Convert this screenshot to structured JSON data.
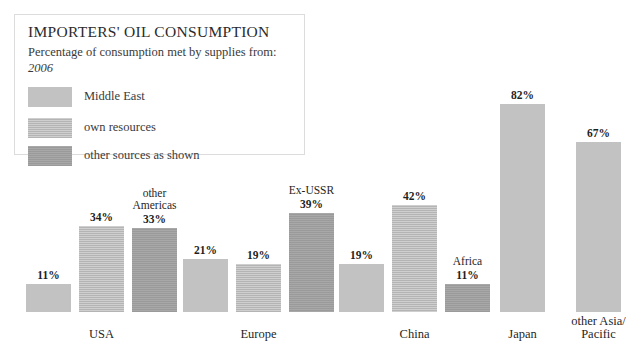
{
  "legend": {
    "title": "IMPORTERS' OIL CONSUMPTION",
    "subtitle": "Percentage of consumption met by supplies from:",
    "year": "2006",
    "items": [
      {
        "label": "Middle East",
        "swatch": "solid-swatch",
        "color": "#c2c2c2"
      },
      {
        "label": "own resources",
        "swatch": "striped-swatch",
        "color": "#c7c7c7"
      },
      {
        "label": "other sources as shown",
        "swatch": "dark-swatch",
        "color": "#a3a3a3"
      }
    ]
  },
  "chart_data": {
    "type": "bar",
    "title": "IMPORTERS' OIL CONSUMPTION",
    "subtitle": "Percentage of consumption met by supplies from:",
    "year": "2006",
    "xlabel": "",
    "ylabel": "Percentage of consumption",
    "ylim": [
      0,
      100
    ],
    "grid": false,
    "legend_position": "top-left",
    "categories": [
      "USA",
      "Europe",
      "China",
      "Japan",
      "other Asia/ Pacific"
    ],
    "series": [
      {
        "name": "Middle East",
        "values": [
          11,
          21,
          19,
          82,
          67
        ]
      },
      {
        "name": "own resources",
        "values": [
          34,
          19,
          42,
          null,
          null
        ]
      },
      {
        "name": "other sources as shown",
        "values": [
          33,
          39,
          11,
          null,
          null
        ]
      }
    ],
    "other_source_names": [
      "other Americas",
      "Ex-USSR",
      "Africa",
      null,
      null
    ],
    "groups": [
      {
        "name": "USA",
        "label_lines": [
          "USA"
        ],
        "bars": [
          {
            "series": "Middle East",
            "value": 11,
            "value_label": "11%",
            "sublabel": "",
            "fill": "solid"
          },
          {
            "series": "own resources",
            "value": 34,
            "value_label": "34%",
            "sublabel": "",
            "fill": "striped"
          },
          {
            "series": "other sources",
            "value": 33,
            "value_label": "33%",
            "sublabel": "other\nAmericas",
            "fill": "dark"
          }
        ]
      },
      {
        "name": "Europe",
        "label_lines": [
          "Europe"
        ],
        "bars": [
          {
            "series": "Middle East",
            "value": 21,
            "value_label": "21%",
            "sublabel": "",
            "fill": "solid"
          },
          {
            "series": "own resources",
            "value": 19,
            "value_label": "19%",
            "sublabel": "",
            "fill": "striped"
          },
          {
            "series": "other sources",
            "value": 39,
            "value_label": "39%",
            "sublabel": "Ex-USSR",
            "fill": "dark"
          }
        ]
      },
      {
        "name": "China",
        "label_lines": [
          "China"
        ],
        "bars": [
          {
            "series": "Middle East",
            "value": 19,
            "value_label": "19%",
            "sublabel": "",
            "fill": "solid"
          },
          {
            "series": "own resources",
            "value": 42,
            "value_label": "42%",
            "sublabel": "",
            "fill": "striped"
          },
          {
            "series": "other sources",
            "value": 11,
            "value_label": "11%",
            "sublabel": "Africa",
            "fill": "dark"
          }
        ]
      },
      {
        "name": "Japan",
        "label_lines": [
          "Japan"
        ],
        "bars": [
          {
            "series": "Middle East",
            "value": 82,
            "value_label": "82%",
            "sublabel": "",
            "fill": "solid"
          }
        ]
      },
      {
        "name": "other Asia/ Pacific",
        "label_lines": [
          "other Asia/",
          "Pacific"
        ],
        "bars": [
          {
            "series": "Middle East",
            "value": 67,
            "value_label": "67%",
            "sublabel": "",
            "fill": "solid"
          }
        ]
      }
    ]
  }
}
